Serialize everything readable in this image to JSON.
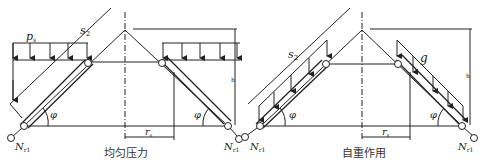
{
  "panels": [
    {
      "caption": "均匀压力",
      "load_label": "p",
      "load_sub": "s",
      "slant_label": "s",
      "slant_sub": "2",
      "angle_left": "φ",
      "angle_right": "φ",
      "radius_label": "r",
      "radius_sub": "s",
      "height_label": "h",
      "reaction_left": "N",
      "reaction_left_sub": "r1",
      "reaction_right": "N",
      "reaction_right_sub": "r1"
    },
    {
      "caption": "自重作用",
      "load_label": "g",
      "slant_label": "s",
      "slant_sub": "2",
      "angle_left": "φ",
      "angle_right": "φ",
      "radius_label": "r",
      "radius_sub": "s",
      "height_label": "h",
      "reaction_left": "N",
      "reaction_left_sub": "r1",
      "reaction_right": "N",
      "reaction_right_sub": "r1"
    }
  ],
  "colors": {
    "line": "#222222",
    "background": "#ffffff"
  }
}
